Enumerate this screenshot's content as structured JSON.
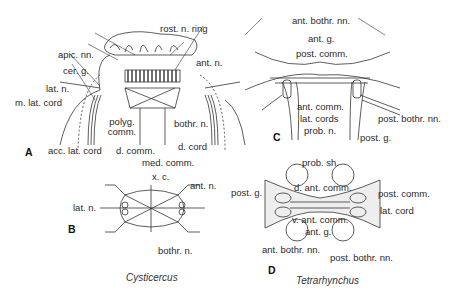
{
  "figure": {
    "panels": [
      {
        "id": "A",
        "labels": [
          "rost. n. ring",
          "apic. nn.",
          "ant. n.",
          "cer. g.",
          "lat. n.",
          "m. lat. cord",
          "polyg. comm.",
          "bothr. n.",
          "d. cord",
          "acc. lat. cord",
          "d. comm.",
          "med. comm."
        ]
      },
      {
        "id": "B",
        "labels": [
          "x. c.",
          "ant. n.",
          "lat. n.",
          "bothr. n."
        ]
      },
      {
        "id": "C",
        "labels": [
          "ant. bothr. nn.",
          "ant. g.",
          "post. comm.",
          "ant. comm.",
          "lat. cords",
          "prob. n.",
          "post. bothr. nn.",
          "post. g."
        ]
      },
      {
        "id": "D",
        "labels": [
          "prob. sh.",
          "post. g.",
          "d. ant. comm.",
          "post. comm.",
          "lat. cord",
          "v. ant. comm.",
          "ant. g.",
          "ant. bothr. nn.",
          "post. bothr. nn."
        ]
      }
    ],
    "captions": {
      "left": "Cysticercus",
      "right": "Tetrarhynchus"
    }
  }
}
